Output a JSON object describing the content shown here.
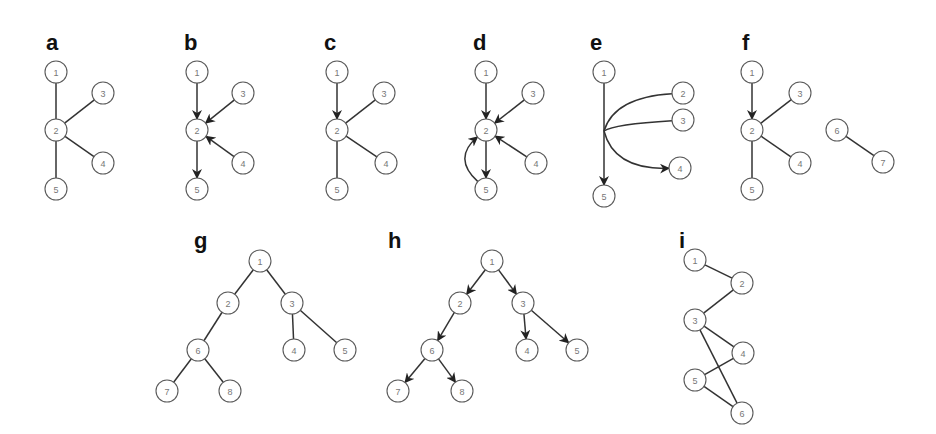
{
  "figure": {
    "node_radius": 11,
    "colors": {
      "edge": "#333333",
      "node_stroke": "#5a5a5a",
      "node_text": "#777777",
      "label": "#111111",
      "background": "#ffffff"
    },
    "panels": [
      {
        "id": "a",
        "label": "a",
        "label_pos": [
          46,
          50
        ],
        "nodes": [
          {
            "id": "1",
            "x": 56,
            "y": 72
          },
          {
            "id": "2",
            "x": 56,
            "y": 130
          },
          {
            "id": "3",
            "x": 103,
            "y": 93
          },
          {
            "id": "4",
            "x": 103,
            "y": 163
          },
          {
            "id": "5",
            "x": 56,
            "y": 189
          }
        ],
        "edges": [
          {
            "from": "1",
            "to": "2",
            "directed": false
          },
          {
            "from": "3",
            "to": "2",
            "directed": false
          },
          {
            "from": "4",
            "to": "2",
            "directed": false
          },
          {
            "from": "2",
            "to": "5",
            "directed": false
          }
        ]
      },
      {
        "id": "b",
        "label": "b",
        "label_pos": [
          184,
          50
        ],
        "nodes": [
          {
            "id": "1",
            "x": 197,
            "y": 72
          },
          {
            "id": "2",
            "x": 197,
            "y": 130
          },
          {
            "id": "3",
            "x": 243,
            "y": 93
          },
          {
            "id": "4",
            "x": 243,
            "y": 163
          },
          {
            "id": "5",
            "x": 197,
            "y": 189
          }
        ],
        "edges": [
          {
            "from": "1",
            "to": "2",
            "directed": true
          },
          {
            "from": "3",
            "to": "2",
            "directed": true
          },
          {
            "from": "4",
            "to": "2",
            "directed": true
          },
          {
            "from": "2",
            "to": "5",
            "directed": true
          }
        ]
      },
      {
        "id": "c",
        "label": "c",
        "label_pos": [
          324,
          50
        ],
        "nodes": [
          {
            "id": "1",
            "x": 337,
            "y": 72
          },
          {
            "id": "2",
            "x": 337,
            "y": 130
          },
          {
            "id": "3",
            "x": 384,
            "y": 93
          },
          {
            "id": "4",
            "x": 386,
            "y": 163
          },
          {
            "id": "5",
            "x": 337,
            "y": 189
          }
        ],
        "edges": [
          {
            "from": "1",
            "to": "2",
            "directed": true
          },
          {
            "from": "3",
            "to": "2",
            "directed": false
          },
          {
            "from": "4",
            "to": "2",
            "directed": false
          },
          {
            "from": "2",
            "to": "5",
            "directed": false
          }
        ]
      },
      {
        "id": "d",
        "label": "d",
        "label_pos": [
          473,
          50
        ],
        "nodes": [
          {
            "id": "1",
            "x": 486,
            "y": 72
          },
          {
            "id": "2",
            "x": 486,
            "y": 130
          },
          {
            "id": "3",
            "x": 533,
            "y": 93
          },
          {
            "id": "4",
            "x": 536,
            "y": 163
          },
          {
            "id": "5",
            "x": 486,
            "y": 189
          }
        ],
        "edges": [
          {
            "from": "1",
            "to": "2",
            "directed": true
          },
          {
            "from": "3",
            "to": "2",
            "directed": true
          },
          {
            "from": "4",
            "to": "2",
            "directed": true
          },
          {
            "from": "2",
            "to": "5",
            "directed": true
          },
          {
            "from": "5",
            "to": "2",
            "directed": true,
            "curve": [
              452,
              158
            ]
          }
        ]
      },
      {
        "id": "e",
        "label": "e",
        "label_pos": [
          590,
          50
        ],
        "nodes": [
          {
            "id": "1",
            "x": 604,
            "y": 72
          },
          {
            "id": "2",
            "x": 683,
            "y": 93
          },
          {
            "id": "3",
            "x": 683,
            "y": 120
          },
          {
            "id": "4",
            "x": 680,
            "y": 168
          },
          {
            "id": "5",
            "x": 604,
            "y": 196
          }
        ],
        "edges": [
          {
            "from": "1",
            "to": "5",
            "directed": true
          },
          {
            "from": "2",
            "to": "4",
            "directed": true,
            "hyperedge": true
          }
        ],
        "hyperedge": {
          "origin": [
            604,
            131
          ],
          "targets": [
            "2",
            "3",
            "4"
          ],
          "arrow_on": "4"
        }
      },
      {
        "id": "f",
        "label": "f",
        "label_pos": [
          742,
          50
        ],
        "nodes": [
          {
            "id": "1",
            "x": 752,
            "y": 72
          },
          {
            "id": "2",
            "x": 752,
            "y": 130
          },
          {
            "id": "3",
            "x": 800,
            "y": 93
          },
          {
            "id": "4",
            "x": 800,
            "y": 163
          },
          {
            "id": "5",
            "x": 752,
            "y": 189
          },
          {
            "id": "6",
            "x": 837,
            "y": 130
          },
          {
            "id": "7",
            "x": 883,
            "y": 162
          }
        ],
        "edges": [
          {
            "from": "1",
            "to": "2",
            "directed": true
          },
          {
            "from": "3",
            "to": "2",
            "directed": false
          },
          {
            "from": "4",
            "to": "2",
            "directed": false
          },
          {
            "from": "2",
            "to": "5",
            "directed": false
          },
          {
            "from": "6",
            "to": "7",
            "directed": false
          }
        ]
      },
      {
        "id": "g",
        "label": "g",
        "label_pos": [
          194,
          248
        ],
        "nodes": [
          {
            "id": "1",
            "x": 260,
            "y": 261
          },
          {
            "id": "2",
            "x": 228,
            "y": 303
          },
          {
            "id": "3",
            "x": 292,
            "y": 303
          },
          {
            "id": "6",
            "x": 198,
            "y": 350
          },
          {
            "id": "4",
            "x": 294,
            "y": 350
          },
          {
            "id": "5",
            "x": 345,
            "y": 350
          },
          {
            "id": "7",
            "x": 167,
            "y": 391
          },
          {
            "id": "8",
            "x": 230,
            "y": 391
          }
        ],
        "edges": [
          {
            "from": "1",
            "to": "2",
            "directed": false
          },
          {
            "from": "1",
            "to": "3",
            "directed": false
          },
          {
            "from": "2",
            "to": "6",
            "directed": false
          },
          {
            "from": "3",
            "to": "4",
            "directed": false
          },
          {
            "from": "3",
            "to": "5",
            "directed": false
          },
          {
            "from": "6",
            "to": "7",
            "directed": false
          },
          {
            "from": "6",
            "to": "8",
            "directed": false
          }
        ]
      },
      {
        "id": "h",
        "label": "h",
        "label_pos": [
          388,
          248
        ],
        "nodes": [
          {
            "id": "1",
            "x": 492,
            "y": 261
          },
          {
            "id": "2",
            "x": 460,
            "y": 303
          },
          {
            "id": "3",
            "x": 523,
            "y": 303
          },
          {
            "id": "6",
            "x": 432,
            "y": 350
          },
          {
            "id": "4",
            "x": 527,
            "y": 350
          },
          {
            "id": "5",
            "x": 577,
            "y": 350
          },
          {
            "id": "7",
            "x": 398,
            "y": 391
          },
          {
            "id": "8",
            "x": 462,
            "y": 391
          }
        ],
        "edges": [
          {
            "from": "1",
            "to": "2",
            "directed": true
          },
          {
            "from": "1",
            "to": "3",
            "directed": true
          },
          {
            "from": "2",
            "to": "6",
            "directed": true
          },
          {
            "from": "3",
            "to": "4",
            "directed": true
          },
          {
            "from": "3",
            "to": "5",
            "directed": true
          },
          {
            "from": "6",
            "to": "7",
            "directed": true
          },
          {
            "from": "6",
            "to": "8",
            "directed": true
          }
        ]
      },
      {
        "id": "i",
        "label": "i",
        "label_pos": [
          679,
          248
        ],
        "nodes": [
          {
            "id": "1",
            "x": 695,
            "y": 260
          },
          {
            "id": "2",
            "x": 742,
            "y": 283
          },
          {
            "id": "3",
            "x": 695,
            "y": 320
          },
          {
            "id": "4",
            "x": 743,
            "y": 353
          },
          {
            "id": "5",
            "x": 695,
            "y": 380
          },
          {
            "id": "6",
            "x": 742,
            "y": 413
          }
        ],
        "edges": [
          {
            "from": "1",
            "to": "2",
            "directed": false
          },
          {
            "from": "2",
            "to": "3",
            "directed": false
          },
          {
            "from": "3",
            "to": "4",
            "directed": false
          },
          {
            "from": "3",
            "to": "6",
            "directed": false
          },
          {
            "from": "4",
            "to": "5",
            "directed": false
          },
          {
            "from": "5",
            "to": "6",
            "directed": false
          }
        ]
      }
    ]
  }
}
